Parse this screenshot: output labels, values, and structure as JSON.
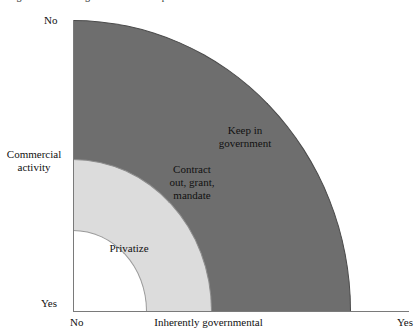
{
  "figure": {
    "caption_clipped": "Figure 1.1  Deciding how to deliver a public service"
  },
  "chart_data": {
    "type": "diagram",
    "title": "",
    "xlabel": "Inherently governmental",
    "ylabel": "Commercial activity",
    "x_ticks": [
      "No",
      "Yes"
    ],
    "y_ticks": [
      "No",
      "Yes"
    ],
    "grid": false,
    "legend_position": "inline-labels",
    "regions": [
      {
        "label": "Privatize",
        "color": "#ffffff",
        "radius_fraction": 0.265,
        "x_extent": [
          "No",
          "low"
        ],
        "y_extent": [
          "Yes",
          "mid"
        ]
      },
      {
        "label": "Contract out, grant, mandate",
        "color": "#dcdcdc",
        "radius_fraction": 0.52,
        "x_extent": [
          "low",
          "mid"
        ],
        "y_extent": [
          "mid",
          "high"
        ]
      },
      {
        "label": "Keep in government",
        "color": "#6e6e6e",
        "radius_fraction": 1.0,
        "x_extent": [
          "mid",
          "Yes"
        ],
        "y_extent": [
          "high",
          "No"
        ]
      }
    ]
  },
  "axes": {
    "y": {
      "title": "Commercial\nactivity",
      "top_label": "No",
      "bottom_label": "Yes"
    },
    "x": {
      "title": "Inherently governmental",
      "left_label": "No",
      "right_label": "Yes"
    }
  },
  "regions": {
    "keep": "Keep in\ngovernment",
    "contract": "Contract\nout, grant,\nmandate",
    "privatize": "Privatize"
  },
  "colors": {
    "band_outer": "#6e6e6e",
    "band_middle": "#dcdcdc",
    "band_inner": "#ffffff",
    "axis": "#7a7a7a",
    "text": "#111111"
  }
}
